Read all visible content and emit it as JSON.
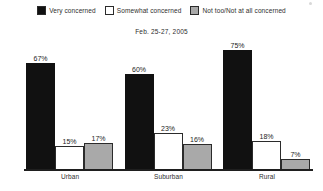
{
  "chart_data": {
    "type": "bar",
    "title": "",
    "subtitle": "Feb. 25-27, 2005",
    "xlabel": "",
    "ylabel": "",
    "ylim": [
      0,
      100
    ],
    "grid": false,
    "legend_position": "top-center",
    "categories": [
      "Urban",
      "Suburban",
      "Rural"
    ],
    "series": [
      {
        "name": "Very concerned",
        "color": "#111111",
        "values": [
          67,
          60,
          75
        ],
        "labels": [
          "67%",
          "60%",
          "75%"
        ]
      },
      {
        "name": "Somewhat concerned",
        "color": "#ffffff",
        "values": [
          15,
          23,
          18
        ],
        "labels": [
          "15%",
          "23%",
          "18%"
        ]
      },
      {
        "name": "Not too/Not at all concerned",
        "color": "#a9a9a9",
        "values": [
          17,
          16,
          7
        ],
        "labels": [
          "17%",
          "16%",
          "7%"
        ]
      }
    ]
  },
  "legend": {
    "items": [
      {
        "label": "Very concerned",
        "swatch": "black"
      },
      {
        "label": "Somewhat concerned",
        "swatch": "white"
      },
      {
        "label": "Not too/Not at all concerned",
        "swatch": "gray"
      }
    ]
  },
  "subtitle": "Feb. 25-27, 2005",
  "axis": {
    "categories": [
      "Urban",
      "Suburban",
      "Rural"
    ]
  }
}
